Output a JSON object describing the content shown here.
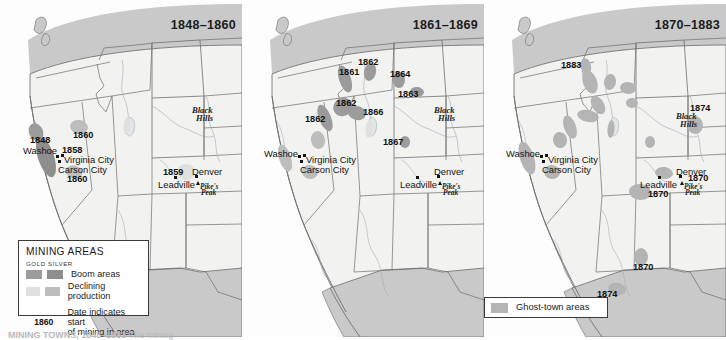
{
  "figure": {
    "caption": "MINING TOWNS, 1848–1883",
    "caption_sub": " The mining"
  },
  "colors": {
    "land": "#f2f2f0",
    "outside": "#c9c9c9",
    "border": "#6d6d6d",
    "boom_gold": "#9b9b9b",
    "boom_silver": "#8e8e8e",
    "declining_gold": "#e0e0e0",
    "declining_silver": "#bdbdbd",
    "ghost": "#b4b4b4",
    "text": "#111111"
  },
  "panels": [
    {
      "id": "panel-1848-1860",
      "title": "1848–1860",
      "date_labels": [
        {
          "text": "1848",
          "x": 30,
          "y": 136
        },
        {
          "text": "1858",
          "x": 62,
          "y": 146
        },
        {
          "text": "1860",
          "x": 73,
          "y": 131
        },
        {
          "text": "1860",
          "x": 67,
          "y": 175
        },
        {
          "text": "1859",
          "x": 163,
          "y": 168
        }
      ],
      "city_labels": [
        {
          "text": "Washoe",
          "x": 23,
          "y": 146
        },
        {
          "text": "Virginia City",
          "x": 64,
          "y": 155
        },
        {
          "text": "Carson City",
          "x": 58,
          "y": 165
        },
        {
          "text": "Leadville",
          "x": 158,
          "y": 180
        },
        {
          "text": "Denver",
          "x": 192,
          "y": 167
        }
      ],
      "place_labels": [
        {
          "text": "Black",
          "x": 192,
          "y": 106
        },
        {
          "text": "Hills",
          "x": 196,
          "y": 114
        }
      ],
      "peak_labels": [
        {
          "text": "Pike's",
          "x": 200,
          "y": 183
        },
        {
          "text": "Peak",
          "x": 201,
          "y": 189
        }
      ],
      "dots": [
        {
          "x": 55.5,
          "y": 154.5
        },
        {
          "x": 60.5,
          "y": 153.5
        },
        {
          "x": 57.5,
          "y": 159.5
        },
        {
          "x": 174.0,
          "y": 176.0
        },
        {
          "x": 195.0,
          "y": 175.0
        }
      ],
      "triangles": [
        {
          "x": 196.0,
          "y": 181.0
        }
      ],
      "areas": [
        {
          "kind": "boom_gold",
          "cx": 36,
          "cy": 132,
          "rx": 7,
          "ry": 9,
          "rot": -25
        },
        {
          "kind": "boom_silver",
          "cx": 46,
          "cy": 157,
          "rx": 8,
          "ry": 21,
          "rot": -18
        },
        {
          "kind": "declining_silver",
          "cx": 79,
          "cy": 127,
          "rx": 9,
          "ry": 7,
          "rot": 10
        },
        {
          "kind": "declining_silver",
          "cx": 74,
          "cy": 172,
          "rx": 8.5,
          "ry": 6.5,
          "rot": 15
        },
        {
          "kind": "declining_gold",
          "cx": 186,
          "cy": 172,
          "rx": 9,
          "ry": 8,
          "rot": 0
        },
        {
          "kind": "declining_gold",
          "cx": 127,
          "cy": 126,
          "rx": 3.5,
          "ry": 9,
          "rot": 5
        }
      ]
    },
    {
      "id": "panel-1861-1869",
      "title": "1861–1869",
      "date_labels": [
        {
          "text": "1862",
          "x": 358,
          "y": 58
        },
        {
          "text": "1861",
          "x": 339,
          "y": 68
        },
        {
          "text": "1864",
          "x": 390,
          "y": 70
        },
        {
          "text": "1863",
          "x": 398,
          "y": 90
        },
        {
          "text": "1862",
          "x": 336,
          "y": 99
        },
        {
          "text": "1866",
          "x": 363,
          "y": 108
        },
        {
          "text": "1862",
          "x": 305,
          "y": 115
        },
        {
          "text": "1867",
          "x": 383,
          "y": 138
        }
      ],
      "city_labels": [
        {
          "text": "Washoe",
          "x": 264,
          "y": 149
        },
        {
          "text": "Virginia City",
          "x": 306,
          "y": 155
        },
        {
          "text": "Carson City",
          "x": 300,
          "y": 165
        },
        {
          "text": "Leadville",
          "x": 400,
          "y": 180
        },
        {
          "text": "Denver",
          "x": 434,
          "y": 167
        }
      ],
      "place_labels": [
        {
          "text": "Black",
          "x": 434,
          "y": 106
        },
        {
          "text": "Hills",
          "x": 438,
          "y": 114
        }
      ],
      "peak_labels": [
        {
          "text": "Pike's",
          "x": 442,
          "y": 183
        },
        {
          "text": "Peak",
          "x": 443,
          "y": 189
        }
      ],
      "dots": [
        {
          "x": 297.5,
          "y": 154.5
        },
        {
          "x": 302.5,
          "y": 153.5
        },
        {
          "x": 299.5,
          "y": 159.5
        },
        {
          "x": 416.0,
          "y": 176.0
        },
        {
          "x": 437.0,
          "y": 175.0
        }
      ],
      "triangles": [
        {
          "x": 438.0,
          "y": 181.0
        }
      ],
      "areas": [
        {
          "kind": "boom_gold",
          "cx": 345,
          "cy": 79,
          "rx": 6,
          "ry": 14,
          "rot": -18
        },
        {
          "kind": "boom_gold",
          "cx": 370,
          "cy": 72,
          "rx": 6,
          "ry": 9,
          "rot": 12
        },
        {
          "kind": "boom_gold",
          "cx": 399,
          "cy": 80,
          "rx": 6,
          "ry": 8,
          "rot": 0
        },
        {
          "kind": "boom_gold",
          "cx": 417,
          "cy": 92,
          "rx": 7,
          "ry": 5,
          "rot": 5
        },
        {
          "kind": "boom_gold",
          "cx": 343,
          "cy": 107,
          "rx": 10,
          "ry": 9,
          "rot": -30
        },
        {
          "kind": "boom_gold",
          "cx": 357,
          "cy": 113,
          "rx": 9,
          "ry": 7,
          "rot": 15
        },
        {
          "kind": "boom_gold",
          "cx": 325,
          "cy": 118,
          "rx": 6,
          "ry": 14,
          "rot": -22
        },
        {
          "kind": "declining_silver",
          "cx": 318,
          "cy": 140,
          "rx": 7,
          "ry": 9,
          "rot": -10
        },
        {
          "kind": "declining_silver",
          "cx": 310,
          "cy": 172,
          "rx": 8,
          "ry": 7,
          "rot": 12
        },
        {
          "kind": "declining_silver",
          "cx": 285,
          "cy": 158,
          "rx": 6,
          "ry": 14,
          "rot": -18
        },
        {
          "kind": "declining_gold",
          "cx": 404,
          "cy": 142,
          "rx": 4,
          "ry": 5,
          "rot": 0
        },
        {
          "kind": "declining_gold",
          "cx": 405,
          "cy": 142,
          "rx": 4.5,
          "ry": 5.5,
          "rot": 0
        },
        {
          "kind": "declining_gold",
          "cx": 369,
          "cy": 129,
          "rx": 3.5,
          "ry": 9,
          "rot": 5
        },
        {
          "kind": "boom_gold",
          "cx": 405,
          "cy": 142,
          "rx": 5,
          "ry": 6,
          "rot": 0
        }
      ]
    },
    {
      "id": "panel-1870-1883",
      "title": "1870–1883",
      "date_labels": [
        {
          "text": "1883",
          "x": 561,
          "y": 61
        },
        {
          "text": "1874",
          "x": 690,
          "y": 104
        },
        {
          "text": "1870",
          "x": 688,
          "y": 174
        },
        {
          "text": "1870",
          "x": 648,
          "y": 190
        },
        {
          "text": "1870",
          "x": 633,
          "y": 263
        },
        {
          "text": "1874",
          "x": 597,
          "y": 290
        }
      ],
      "city_labels": [
        {
          "text": "Washoe",
          "x": 506,
          "y": 149
        },
        {
          "text": "Virginia City",
          "x": 548,
          "y": 155
        },
        {
          "text": "Carson City",
          "x": 542,
          "y": 165
        },
        {
          "text": "Leadville",
          "x": 640,
          "y": 180
        },
        {
          "text": "Denver",
          "x": 676,
          "y": 167
        }
      ],
      "place_labels": [
        {
          "text": "Black",
          "x": 676,
          "y": 112
        },
        {
          "text": "Hills",
          "x": 680,
          "y": 120
        }
      ],
      "peak_labels": [
        {
          "text": "Pike's",
          "x": 684,
          "y": 183
        },
        {
          "text": "Peak",
          "x": 685,
          "y": 189
        }
      ],
      "dots": [
        {
          "x": 539.5,
          "y": 154.5
        },
        {
          "x": 544.5,
          "y": 153.5
        },
        {
          "x": 541.5,
          "y": 159.5
        },
        {
          "x": 658.0,
          "y": 176.0
        },
        {
          "x": 679.0,
          "y": 175.0
        }
      ],
      "triangles": [
        {
          "x": 680.0,
          "y": 181.0
        }
      ],
      "areas": [
        {
          "kind": "ghost",
          "cx": 586,
          "cy": 66,
          "rx": 5,
          "ry": 8,
          "rot": -15
        },
        {
          "kind": "ghost",
          "cx": 590,
          "cy": 82,
          "rx": 7,
          "ry": 12,
          "rot": -20
        },
        {
          "kind": "ghost",
          "cx": 610,
          "cy": 82,
          "rx": 6,
          "ry": 8,
          "rot": 10
        },
        {
          "kind": "ghost",
          "cx": 628,
          "cy": 88,
          "rx": 8,
          "ry": 6,
          "rot": 5
        },
        {
          "kind": "ghost",
          "cx": 598,
          "cy": 105,
          "rx": 6,
          "ry": 10,
          "rot": -32
        },
        {
          "kind": "ghost",
          "cx": 588,
          "cy": 116,
          "rx": 11,
          "ry": 6,
          "rot": 12
        },
        {
          "kind": "ghost",
          "cx": 632,
          "cy": 103,
          "rx": 6,
          "ry": 5,
          "rot": 0
        },
        {
          "kind": "ghost",
          "cx": 570,
          "cy": 127,
          "rx": 6,
          "ry": 12,
          "rot": -20
        },
        {
          "kind": "ghost",
          "cx": 560,
          "cy": 140,
          "rx": 7,
          "ry": 8,
          "rot": -10
        },
        {
          "kind": "ghost",
          "cx": 552,
          "cy": 172,
          "rx": 8,
          "ry": 7,
          "rot": 12
        },
        {
          "kind": "ghost",
          "cx": 527,
          "cy": 158,
          "rx": 7,
          "ry": 17,
          "rot": -18
        },
        {
          "kind": "ghost",
          "cx": 650,
          "cy": 142,
          "rx": 5,
          "ry": 6,
          "rot": 0
        },
        {
          "kind": "ghost",
          "cx": 611,
          "cy": 129,
          "rx": 3.5,
          "ry": 9,
          "rot": 5
        },
        {
          "kind": "ghost",
          "cx": 695,
          "cy": 125,
          "rx": 8,
          "ry": 9,
          "rot": -10
        },
        {
          "kind": "ghost",
          "cx": 664,
          "cy": 173,
          "rx": 9,
          "ry": 6,
          "rot": 8
        },
        {
          "kind": "ghost",
          "cx": 640,
          "cy": 192,
          "rx": 11,
          "ry": 8,
          "rot": 5
        },
        {
          "kind": "ghost",
          "cx": 641,
          "cy": 257,
          "rx": 7,
          "ry": 9,
          "rot": 0
        },
        {
          "kind": "ghost",
          "cx": 617,
          "cy": 289,
          "rx": 9,
          "ry": 6,
          "rot": 10
        }
      ]
    }
  ],
  "legend_main": {
    "title": "MINING AREAS",
    "subheads": "GOLD SILVER",
    "gold_label": "GOLD",
    "silver_label": "SILVER",
    "rows": [
      {
        "label": "Boom areas"
      },
      {
        "label": "Declining production"
      }
    ],
    "date_key": "1860",
    "date_text_line1": "Date indicates start",
    "date_text_line2": "of mining in area"
  },
  "legend_ghost": {
    "label": "Ghost-town areas"
  }
}
